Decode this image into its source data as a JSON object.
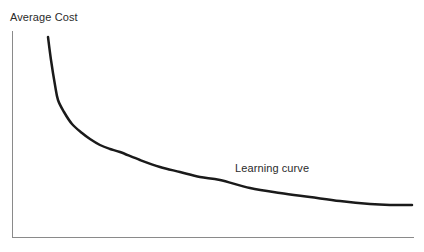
{
  "figure": {
    "background_color": "#ffffff",
    "width": 424,
    "height": 252
  },
  "labels": {
    "y_axis_title": "Average Cost",
    "curve_annotation": "Learning curve"
  },
  "style": {
    "axis_color": "#8a8a8a",
    "axis_width": 1,
    "curve_color": "#1a1a1a",
    "curve_width": 2.5,
    "text_color": "#2b2b2b"
  },
  "chart_data": {
    "type": "line",
    "title": "",
    "subtitle": "",
    "xlabel": "",
    "ylabel": "Average Cost",
    "grid": false,
    "legend": null,
    "annotations": [
      {
        "text": "Learning curve",
        "x": 235,
        "y": 162
      }
    ],
    "axes": {
      "x_axis": {
        "x_start": 12,
        "x_end": 414,
        "y": 237
      },
      "y_axis": {
        "x": 12,
        "y_start": 31,
        "y_end": 237
      },
      "ticks": [],
      "tick_labels": []
    },
    "series": [
      {
        "name": "Learning curve",
        "description": "Decreasing convex curve: average cost falls steeply then flattens toward an asymptote as cumulative output rises",
        "points": [
          [
            48,
            37
          ],
          [
            51,
            60
          ],
          [
            55,
            85
          ],
          [
            58,
            100
          ],
          [
            64,
            112
          ],
          [
            72,
            124
          ],
          [
            82,
            133
          ],
          [
            90,
            139
          ],
          [
            100,
            145
          ],
          [
            110,
            149
          ],
          [
            120,
            152
          ],
          [
            140,
            160
          ],
          [
            160,
            167
          ],
          [
            180,
            172
          ],
          [
            200,
            177
          ],
          [
            220,
            180
          ],
          [
            250,
            188
          ],
          [
            280,
            193
          ],
          [
            310,
            197
          ],
          [
            340,
            201
          ],
          [
            370,
            204
          ],
          [
            390,
            205
          ],
          [
            412,
            205
          ]
        ]
      }
    ]
  }
}
